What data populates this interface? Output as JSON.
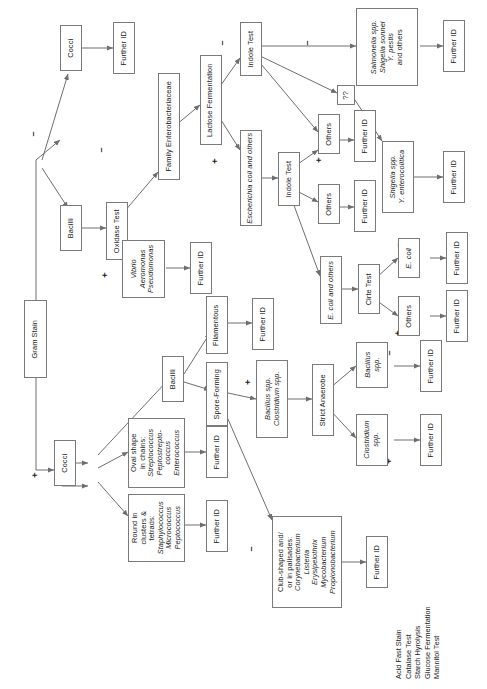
{
  "orientation": "rotated-90-ccw",
  "signs": {
    "negative": "–",
    "positive": "+"
  },
  "nodes": {
    "gram_stain": "Gram Stain",
    "cocci_neg": "Cocci",
    "further_id_1": "Further ID",
    "bacilli_neg": "Bacilli",
    "oxidase_test": "Oxidase Test",
    "vibrio_group": "Vibrio\nAeromonas\nPseudomonas",
    "further_id_2": "Further ID",
    "family_entero": "Family Enterobacteriaceae",
    "lactose_ferm": "Lactose Fermentation",
    "indole_test_1": "Indole Test",
    "salmonella_group": "Salmonella spp.\nShigella sonnei\nY. pestis\nand others",
    "further_id_3": "Further ID",
    "unknown_qq": "??",
    "shigella_group": "Shigella spp.\nY. enterocolitica",
    "further_id_4": "Further ID",
    "ecoli_others_1": "Escherichia coli and others",
    "indole_test_2": "Indole Test",
    "others_1": "Others",
    "further_id_5": "Further ID",
    "others_2": "Others",
    "further_id_6": "Further ID",
    "ecoli_others_2": "E. coli and others",
    "citrate_test": "Cirte Test",
    "ecoli": "E. coli",
    "further_id_7": "Further ID",
    "others_3": "Others",
    "further_id_8": "Further ID",
    "cocci_pos": "Cocci",
    "bacilli_pos": "Bacilli",
    "oval_chains": "Oval shape\nin chains:\nStreptococcus\nPeptostrepto-\ncoccus\nEnterococcus",
    "further_id_9": "Further ID",
    "round_clusters": "Round in\nclusters &\ntetrads:\nStaphylococcus\nMicrococcus\nPeptococcus",
    "further_id_10": "Further ID",
    "filamentous": "Filamentous",
    "further_id_11": "Further ID",
    "spore_forming": "Spore-Forming",
    "bacillus_clostridium": "Bacillus spp.\nClostridium spp.",
    "strict_anaerobe": "Strict Anaerobe",
    "bacillus_spp": "Bacillus\nspp.",
    "further_id_12": "Further ID",
    "clostridium_spp": "Clostridium\nspp.",
    "further_id_13": "Further ID",
    "club_shaped": "Club-shaped and/\nor in palisades:\nCorynebacterium\nListeria\nErysipelothrix\nMycobacterium\nPropionobacterium",
    "further_id_14": "Further ID"
  },
  "test_list": "Acid Fast Stain\nCatalase Test\nStarch Hyrolysis\nGlucose Fermentation\nMannitol Test",
  "colors": {
    "border": "#7a7a7a",
    "text": "#1a1a1a",
    "background": "#ffffff",
    "edge": "#6e6e6e"
  }
}
